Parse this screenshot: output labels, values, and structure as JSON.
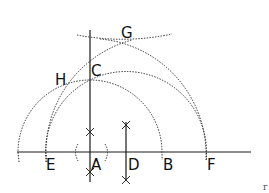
{
  "diagram": {
    "type": "geometric-construction",
    "points": {
      "A": {
        "label": "A",
        "x": 90,
        "y": 152
      },
      "B": {
        "label": "B",
        "x": 162,
        "y": 152
      },
      "C": {
        "label": "C",
        "x": 90,
        "y": 80
      },
      "D": {
        "label": "D",
        "x": 126,
        "y": 152
      },
      "E": {
        "label": "E",
        "x": 46,
        "y": 152
      },
      "F": {
        "label": "F",
        "x": 206,
        "y": 152
      },
      "G": {
        "label": "G",
        "x": 130,
        "y": 40
      },
      "H": {
        "label": "H",
        "x": 67,
        "y": 84
      }
    },
    "labels": {
      "A": "A",
      "B": "B",
      "C": "C",
      "D": "D",
      "E": "E",
      "F": "F",
      "G": "G",
      "H": "H"
    },
    "corner_mark": "r",
    "colors": {
      "line": "#1a1a1a",
      "background": "#ffffff"
    }
  }
}
